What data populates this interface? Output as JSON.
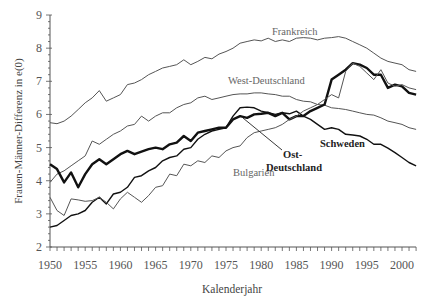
{
  "chart_data": {
    "type": "line",
    "title": "",
    "xlabel": "Kalenderjahr",
    "ylabel": "Frauen-Männer-Differenz in e(0)",
    "xlim": [
      1950,
      2002
    ],
    "ylim": [
      2,
      9
    ],
    "xticks": [
      1950,
      1955,
      1960,
      1965,
      1970,
      1975,
      1980,
      1985,
      1990,
      1995,
      2000
    ],
    "yticks": [
      2,
      3,
      4,
      5,
      6,
      7,
      8,
      9
    ],
    "grid": false,
    "legend": "inline labels",
    "x": [
      1950,
      1951,
      1952,
      1953,
      1954,
      1955,
      1956,
      1957,
      1958,
      1959,
      1960,
      1961,
      1962,
      1963,
      1964,
      1965,
      1966,
      1967,
      1968,
      1969,
      1970,
      1971,
      1972,
      1973,
      1974,
      1975,
      1976,
      1977,
      1978,
      1979,
      1980,
      1981,
      1982,
      1983,
      1984,
      1985,
      1986,
      1987,
      1988,
      1989,
      1990,
      1991,
      1992,
      1993,
      1994,
      1995,
      1996,
      1997,
      1998,
      1999,
      2000,
      2001,
      2002
    ],
    "series": [
      {
        "name": "Frankreich",
        "color": "#555555",
        "width": 1,
        "values": [
          5.75,
          5.72,
          5.8,
          5.95,
          6.15,
          6.35,
          6.5,
          6.72,
          6.4,
          6.5,
          6.6,
          6.9,
          6.95,
          7.05,
          7.2,
          7.3,
          7.4,
          7.45,
          7.5,
          7.65,
          7.5,
          7.6,
          7.72,
          7.68,
          7.82,
          7.9,
          8.0,
          8.15,
          8.2,
          8.25,
          8.22,
          8.3,
          8.2,
          8.25,
          8.2,
          8.3,
          8.32,
          8.3,
          8.25,
          8.3,
          8.32,
          8.35,
          8.3,
          8.2,
          8.1,
          8.0,
          7.85,
          7.7,
          7.6,
          7.55,
          7.5,
          7.35,
          7.3
        ]
      },
      {
        "name": "West-Deutschland",
        "color": "#555555",
        "width": 1,
        "values": [
          3.95,
          4.2,
          4.3,
          4.45,
          4.6,
          4.75,
          5.2,
          5.1,
          5.25,
          5.4,
          5.5,
          5.65,
          5.7,
          5.95,
          5.8,
          5.95,
          6.05,
          6.05,
          6.2,
          6.3,
          6.35,
          6.5,
          6.55,
          6.45,
          6.5,
          6.55,
          6.6,
          6.62,
          6.62,
          6.65,
          6.65,
          6.62,
          6.6,
          6.55,
          6.55,
          6.45,
          6.4,
          6.38,
          6.3,
          6.28,
          6.2,
          6.18,
          6.15,
          6.1,
          6.05,
          6.0,
          5.98,
          5.9,
          5.8,
          5.75,
          5.7,
          5.6,
          5.55
        ]
      },
      {
        "name": "Ost-Deutschland",
        "color": "#111111",
        "width": 1.4,
        "values": [
          2.6,
          2.65,
          2.8,
          2.95,
          3.0,
          3.1,
          3.35,
          3.5,
          3.3,
          3.6,
          3.65,
          3.8,
          4.1,
          4.15,
          4.3,
          4.4,
          4.6,
          4.7,
          4.75,
          4.95,
          5.0,
          5.25,
          5.4,
          5.5,
          5.55,
          5.6,
          5.95,
          6.2,
          6.22,
          6.2,
          6.1,
          6.05,
          6.0,
          6.05,
          6.02,
          6.1,
          5.95,
          5.85,
          5.7,
          5.55,
          5.6,
          5.55,
          5.4,
          5.38,
          5.35,
          5.25,
          5.1,
          5.1,
          4.98,
          4.85,
          4.7,
          4.55,
          4.45
        ]
      },
      {
        "name": "Schweden",
        "color": "#111111",
        "width": 2.4,
        "values": [
          4.5,
          4.35,
          3.95,
          4.25,
          3.8,
          4.2,
          4.5,
          4.65,
          4.5,
          4.65,
          4.8,
          4.9,
          4.8,
          4.88,
          4.95,
          5.0,
          4.95,
          5.1,
          5.15,
          5.35,
          5.2,
          5.45,
          5.5,
          5.55,
          5.6,
          5.6,
          5.85,
          5.95,
          5.9,
          6.0,
          6.02,
          6.05,
          5.95,
          6.05,
          5.85,
          5.95,
          5.95,
          6.1,
          6.2,
          6.3,
          7.05,
          7.2,
          7.35,
          7.55,
          7.5,
          7.4,
          7.2,
          7.2,
          6.8,
          6.9,
          6.85,
          6.65,
          6.6
        ]
      },
      {
        "name": "Bulgarien",
        "color": "#555555",
        "width": 1,
        "values": [
          3.5,
          3.1,
          2.95,
          3.45,
          3.42,
          3.38,
          3.4,
          3.5,
          3.35,
          3.15,
          3.45,
          3.65,
          3.5,
          3.35,
          3.55,
          3.8,
          3.85,
          4.2,
          4.15,
          4.5,
          4.45,
          4.6,
          4.55,
          4.75,
          4.7,
          4.9,
          5.0,
          5.05,
          5.3,
          5.45,
          5.5,
          5.55,
          5.6,
          5.7,
          5.85,
          5.95,
          6.1,
          6.2,
          6.3,
          6.45,
          6.6,
          6.5,
          7.3,
          7.55,
          7.45,
          7.25,
          7.05,
          7.35,
          6.95,
          6.85,
          6.9,
          6.8,
          6.75
        ]
      }
    ],
    "annotations": [
      {
        "text": "Frankreich",
        "x": 1981,
        "y": 8.55
      },
      {
        "text": "West-Deutschland",
        "x": 1970,
        "y": 6.85
      },
      {
        "text": "Bulgarien",
        "x": 1975.5,
        "y": 4.45
      },
      {
        "text": "Ost-Deutschland",
        "x": 1986.5,
        "y": 5.05,
        "bold": true,
        "pointer_to": [
          1977.5,
          6.0
        ]
      },
      {
        "text": "Schweden",
        "x": 1991,
        "y": 5.45,
        "bold": true
      }
    ]
  },
  "labels": {
    "xlabel": "Kalenderjahr",
    "ylabel": "Frauen-Männer-Differenz in e(0)",
    "frankreich": "Frankreich",
    "west": "West-Deutschland",
    "bulgarien": "Bulgarien",
    "ost_line1": "Ost-",
    "ost_line2": "Deutschland",
    "schweden": "Schweden"
  }
}
